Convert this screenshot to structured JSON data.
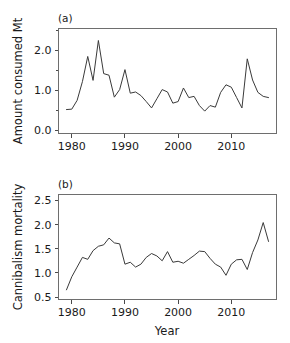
{
  "figure": {
    "background": "#ffffff",
    "line_color": "#3a3a3a",
    "frame_color": "#6e6e6e"
  },
  "panel_a": {
    "tag": "(a)",
    "ylabel": "Amount consumed Mt",
    "xlabel": "",
    "ytick_labels": [
      "0.0",
      "1.0",
      "2.0"
    ],
    "xtick_labels": [
      "1980",
      "1990",
      "2000",
      "2010"
    ]
  },
  "panel_b": {
    "tag": "(b)",
    "ylabel": "Cannibalism mortality",
    "xlabel": "Year",
    "ytick_labels": [
      "0.5",
      "1.0",
      "1.5",
      "2.0",
      "2.5"
    ],
    "xtick_labels": [
      "1980",
      "1990",
      "2000",
      "2010"
    ]
  },
  "chart_data": [
    {
      "type": "line",
      "title": "(a)",
      "xlabel": "",
      "ylabel": "Amount consumed Mt",
      "xlim": [
        1977.5,
        2018.5
      ],
      "ylim": [
        -0.08,
        2.55
      ],
      "xticks": [
        1980,
        1990,
        2000,
        2010
      ],
      "yticks": [
        0.0,
        1.0,
        2.0
      ],
      "yminorticks": [
        0.5,
        1.5,
        2.5
      ],
      "grid": false,
      "legend": "none",
      "x": [
        1979,
        1980,
        1981,
        1982,
        1983,
        1984,
        1985,
        1986,
        1987,
        1988,
        1989,
        1990,
        1991,
        1992,
        1993,
        1994,
        1995,
        1996,
        1997,
        1998,
        1999,
        2000,
        2001,
        2002,
        2003,
        2004,
        2005,
        2006,
        2007,
        2008,
        2009,
        2010,
        2011,
        2012,
        2013,
        2014,
        2015,
        2016,
        2017
      ],
      "values": [
        0.52,
        0.53,
        0.75,
        1.22,
        1.85,
        1.25,
        2.25,
        1.42,
        1.38,
        0.83,
        1.02,
        1.52,
        0.93,
        0.96,
        0.87,
        0.72,
        0.56,
        0.79,
        1.02,
        0.96,
        0.68,
        0.72,
        1.06,
        0.82,
        0.85,
        0.62,
        0.48,
        0.62,
        0.58,
        0.95,
        1.14,
        1.08,
        0.82,
        0.56,
        1.79,
        1.26,
        0.95,
        0.85,
        0.82
      ]
    },
    {
      "type": "line",
      "title": "(b)",
      "xlabel": "Year",
      "ylabel": "Cannibalism mortality",
      "xlim": [
        1977.5,
        2018.5
      ],
      "ylim": [
        0.45,
        2.62
      ],
      "xticks": [
        1980,
        1990,
        2000,
        2010
      ],
      "yticks": [
        0.5,
        1.0,
        1.5,
        2.0,
        2.5
      ],
      "grid": false,
      "legend": "none",
      "x": [
        1979,
        1980,
        1981,
        1982,
        1983,
        1984,
        1985,
        1986,
        1987,
        1988,
        1989,
        1990,
        1991,
        1992,
        1993,
        1994,
        1995,
        1996,
        1997,
        1998,
        1999,
        2000,
        2001,
        2002,
        2003,
        2004,
        2005,
        2006,
        2007,
        2008,
        2009,
        2010,
        2011,
        2012,
        2013,
        2014,
        2015,
        2016,
        2017
      ],
      "values": [
        0.65,
        0.92,
        1.12,
        1.32,
        1.28,
        1.46,
        1.55,
        1.58,
        1.72,
        1.62,
        1.6,
        1.18,
        1.22,
        1.12,
        1.18,
        1.32,
        1.4,
        1.35,
        1.25,
        1.44,
        1.22,
        1.24,
        1.2,
        1.28,
        1.36,
        1.45,
        1.44,
        1.3,
        1.18,
        1.12,
        0.95,
        1.18,
        1.27,
        1.28,
        1.07,
        1.42,
        1.68,
        2.04,
        1.65
      ]
    }
  ]
}
